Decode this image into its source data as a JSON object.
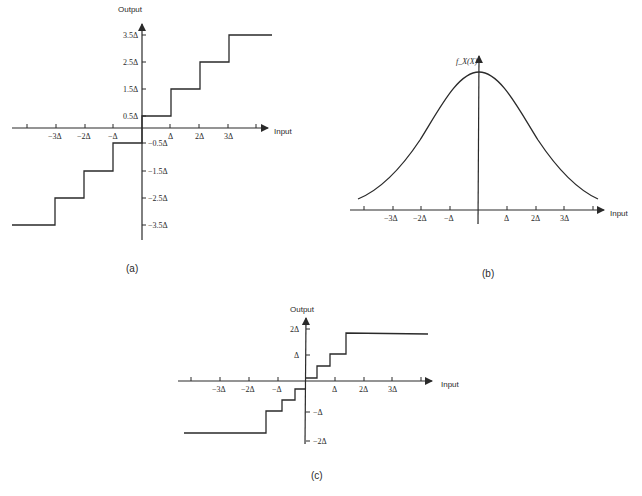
{
  "figure_a": {
    "caption": "(a)",
    "y_axis_label": "Output",
    "x_axis_label": "Input",
    "x_ticks": [
      "-3Δ",
      "-2Δ",
      "-Δ",
      "Δ",
      "2Δ",
      "3Δ"
    ],
    "y_ticks_pos": [
      "3.5Δ",
      "2.5Δ",
      "1.5Δ",
      "0.5Δ"
    ],
    "y_ticks_neg": [
      "-0.5Δ",
      "-1.5Δ",
      "-2.5Δ",
      "-3.5Δ"
    ],
    "description": "Midrise uniform quantizer staircase characteristic"
  },
  "figure_b": {
    "caption": "(b)",
    "y_axis_label": "f_X(X)",
    "x_axis_label": "Input",
    "x_ticks": [
      "-3Δ",
      "-2Δ",
      "-Δ",
      "Δ",
      "2Δ",
      "3Δ"
    ],
    "description": "Bell-shaped (Gaussian-like) probability density function"
  },
  "figure_c": {
    "caption": "(c)",
    "y_axis_label": "Output",
    "x_axis_label": "Input",
    "x_ticks": [
      "-3Δ",
      "-2Δ",
      "-Δ",
      "Δ",
      "2Δ",
      "3Δ"
    ],
    "y_ticks_pos": [
      "2Δ",
      "Δ"
    ],
    "y_ticks_neg": [
      "-Δ",
      "-2Δ"
    ],
    "description": "Nonuniform quantizer staircase with finer steps near origin"
  }
}
